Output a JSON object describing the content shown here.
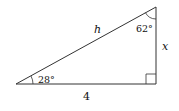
{
  "diagram": {
    "type": "right-triangle",
    "vertices": {
      "bottom_left": [
        16,
        84
      ],
      "bottom_right": [
        156,
        84
      ],
      "top": [
        156,
        7
      ]
    },
    "labels": {
      "hypotenuse": "h",
      "vertical_side": "x",
      "base": "4",
      "angle_bottom_left": "28°",
      "angle_top": "62°"
    },
    "right_angle_at": "bottom_right",
    "stroke_color": "#333333"
  }
}
